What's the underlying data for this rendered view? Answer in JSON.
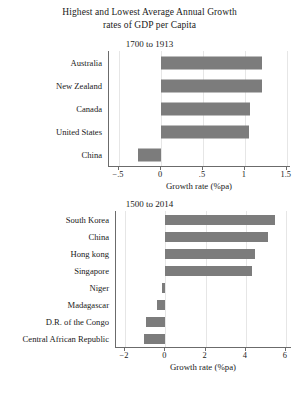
{
  "figure": {
    "title_line1": "Highest and Lowest Average Annual Growth",
    "title_line2": "rates of GDP per Capita",
    "bar_color": "#7c7c7c",
    "axis_color": "#6b6b6b",
    "grid_color": "#e6e6e6"
  },
  "chart_data": [
    {
      "type": "bar",
      "orientation": "horizontal",
      "title": "1700 to 1913",
      "xlabel": "Growth rate (%pa)",
      "ylabel": "",
      "categories": [
        "Australia",
        "New Zealand",
        "Canada",
        "United States",
        "China"
      ],
      "values": [
        1.2,
        1.2,
        1.06,
        1.05,
        -0.28
      ],
      "xlim": [
        -0.62,
        1.55
      ],
      "xticks": [
        -0.5,
        0,
        0.5,
        1,
        1.5
      ],
      "xticklabels": [
        "−.5",
        "0",
        ".5",
        "1",
        "1.5"
      ],
      "grid": true,
      "legend": false
    },
    {
      "type": "bar",
      "orientation": "horizontal",
      "title": "1500 to 2014",
      "xlabel": "Growth rate (%pa)",
      "ylabel": "",
      "categories": [
        "South Korea",
        "China",
        "Hong kong",
        "Singapore",
        "Niger",
        "Madagascar",
        "D.R. of the Congo",
        "Central African Republic"
      ],
      "values": [
        5.45,
        5.1,
        4.45,
        4.3,
        -0.15,
        -0.4,
        -0.95,
        -1.05
      ],
      "xlim": [
        -2.45,
        6.3
      ],
      "xticks": [
        -2,
        0,
        2,
        4,
        6
      ],
      "xticklabels": [
        "−2",
        "0",
        "2",
        "4",
        "6"
      ],
      "grid": true,
      "legend": false
    }
  ]
}
